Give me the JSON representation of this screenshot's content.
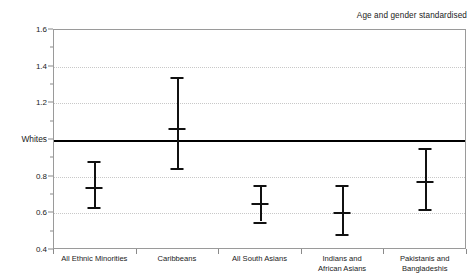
{
  "chart_data": {
    "type": "scatter",
    "title": "",
    "annotation": "Age and gender standardised",
    "xlabel": "",
    "ylabel": "",
    "ylim": [
      0.4,
      1.6
    ],
    "yticks": [
      0.4,
      0.6,
      0.8,
      1.0,
      1.2,
      1.4,
      1.6
    ],
    "ytick_labels": [
      "0.4",
      "0.6",
      "0.8",
      "Whites",
      "1.2",
      "1.4",
      "1.6"
    ],
    "grid": true,
    "gridlines_at": [
      0.6,
      0.8,
      1.2,
      1.4
    ],
    "reference_line": {
      "value": 1.0,
      "label": "Whites"
    },
    "legend": "none",
    "categories": [
      "All Ethnic Minorities",
      "Caribbeans",
      "All South Asians",
      "Indians and African Asians",
      "Pakistanis and Bangladeshis"
    ],
    "category_label_lines": [
      [
        "All Ethnic Minorities"
      ],
      [
        "Caribbeans"
      ],
      [
        "All South Asians"
      ],
      [
        "Indians and",
        "African Asians"
      ],
      [
        "Pakistanis and",
        "Bangladeshis"
      ]
    ],
    "series": [
      {
        "name": "Ratio vs Whites",
        "point_estimates": [
          0.74,
          1.06,
          0.65,
          0.6,
          0.77
        ],
        "ci_lower": [
          0.63,
          0.84,
          0.55,
          0.48,
          0.62
        ],
        "ci_upper": [
          0.88,
          1.34,
          0.75,
          0.75,
          0.95
        ]
      }
    ]
  },
  "colors": {
    "marker": "#111111",
    "reference_line": "#000000",
    "gridline": "#c8c8c8",
    "frame": "#9a9a9a",
    "text": "#1a1a1a",
    "background": "#ffffff"
  }
}
